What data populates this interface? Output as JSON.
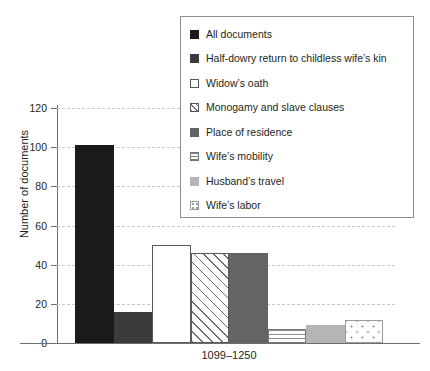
{
  "chart_data": {
    "type": "bar",
    "title": "",
    "xlabel": "",
    "ylabel": "Number of documents",
    "categories": [
      "1099–1250"
    ],
    "ylim": [
      0,
      120
    ],
    "yticks": [
      0,
      20,
      40,
      60,
      80,
      100,
      120
    ],
    "ytick_labels": [
      "0",
      "20",
      "40",
      "60",
      "80",
      "100",
      "120"
    ],
    "grid": true,
    "legend_position": "top-right",
    "series": [
      {
        "name": "All documents",
        "values": [
          101
        ],
        "swatch": "black",
        "fill": "solid-black"
      },
      {
        "name": "Half-dowry return to childless wife’s kin",
        "values": [
          16
        ],
        "swatch": "darkgray2",
        "fill": "solid-dark-gray"
      },
      {
        "name": "Widow’s oath",
        "values": [
          50
        ],
        "swatch": "white",
        "fill": "white-outline"
      },
      {
        "name": "Monogamy and slave clauses",
        "values": [
          46
        ],
        "swatch": "diag",
        "fill": "diagonal-hatch"
      },
      {
        "name": "Place of residence",
        "values": [
          46
        ],
        "swatch": "midgray",
        "fill": "solid-mid-gray"
      },
      {
        "name": "Wife’s mobility",
        "values": [
          7
        ],
        "swatch": "hlines",
        "fill": "horizontal-lines"
      },
      {
        "name": "Husband’s travel",
        "values": [
          9
        ],
        "swatch": "lightgray",
        "fill": "solid-light-gray"
      },
      {
        "name": "Wife’s labor",
        "values": [
          12
        ],
        "swatch": "dots",
        "fill": "dotted"
      }
    ]
  },
  "axis": {
    "y_title": "Number of documents",
    "y_tick_0": "0",
    "y_tick_20": "20",
    "y_tick_40": "40",
    "y_tick_60": "60",
    "y_tick_80": "80",
    "y_tick_100": "100",
    "y_tick_120": "120",
    "x_category_0": "1099–1250"
  },
  "legend": {
    "items": [
      {
        "label": "All documents"
      },
      {
        "label": "Half-dowry return to childless wife’s kin"
      },
      {
        "label": "Widow’s oath"
      },
      {
        "label": "Monogamy and slave clauses"
      },
      {
        "label": "Place of residence"
      },
      {
        "label": "Wife’s mobility"
      },
      {
        "label": "Husband’s travel"
      },
      {
        "label": "Wife’s labor"
      }
    ]
  },
  "colors": {
    "black": "#1a1a1a",
    "dark_gray": "#3b3b3b",
    "mid_gray": "#636466",
    "light_gray": "#b4b5b7",
    "hatch_line": "#6d6e70",
    "axis": "#6d6e70",
    "grid": "#c9c9c9",
    "text": "#231f20",
    "background": "#ffffff"
  }
}
